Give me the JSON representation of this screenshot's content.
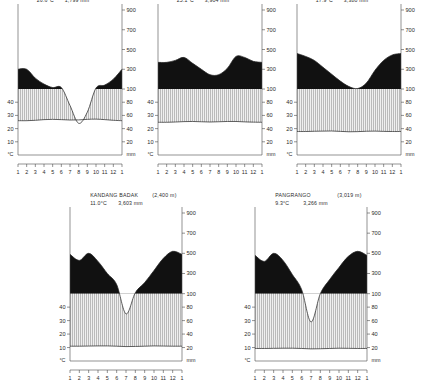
{
  "figure": {
    "caption_present": false,
    "units": {
      "temperature": "°C",
      "precipitation": "mm"
    },
    "month_labels": [
      "1",
      "2",
      "3",
      "4",
      "5",
      "6",
      "7",
      "8",
      "9",
      "10",
      "11",
      "12",
      "1"
    ],
    "temp_ticks_top": [
      "40",
      "30",
      "20",
      "10"
    ],
    "temp_ticks_bottom": [
      "40",
      "30",
      "20",
      "10"
    ],
    "precip_ticks": [
      "900",
      "700",
      "500",
      "300",
      "100",
      "80",
      "60",
      "40",
      "20"
    ],
    "colors": {
      "perhumid_fill": "#111111",
      "humid_fill": "#d8d8d8",
      "axis": "#4a4a4a",
      "curve": "#2a2a2a",
      "background": "#ffffff"
    }
  },
  "chart_data": [
    {
      "type": "area",
      "title": "JAKARTA",
      "altitude": "(8 m)",
      "mean_temp": "26.6°C",
      "annual_precip": "1,799 mm",
      "xlabel": "",
      "ylabel": "°C",
      "y2label": "mm",
      "categories": [
        "1",
        "2",
        "3",
        "4",
        "5",
        "6",
        "7",
        "8",
        "9",
        "10",
        "11",
        "12",
        "1"
      ],
      "series": [
        {
          "name": "precipitation",
          "values": [
            300,
            300,
            210,
            150,
            115,
            115,
            75,
            48,
            65,
            110,
            140,
            200,
            300
          ]
        },
        {
          "name": "temperature",
          "values": [
            26.0,
            26.0,
            26.3,
            26.8,
            27.0,
            26.8,
            26.5,
            26.6,
            27.0,
            27.2,
            26.8,
            26.3,
            26.0
          ]
        }
      ],
      "ylim": [
        0,
        50
      ],
      "y2lim": [
        0,
        900
      ],
      "grid": false
    },
    {
      "type": "area",
      "title": "BOGOR",
      "altitude": "(250 m)",
      "mean_temp": "25.1°C",
      "annual_precip": "3,904 mm",
      "xlabel": "",
      "ylabel": "°C",
      "y2label": "mm",
      "categories": [
        "1",
        "2",
        "3",
        "4",
        "5",
        "6",
        "7",
        "8",
        "9",
        "10",
        "11",
        "12",
        "1"
      ],
      "series": [
        {
          "name": "precipitation",
          "values": [
            370,
            370,
            390,
            420,
            360,
            300,
            245,
            245,
            310,
            430,
            420,
            380,
            370
          ]
        },
        {
          "name": "temperature",
          "values": [
            24.8,
            24.8,
            25.0,
            25.3,
            25.4,
            25.2,
            25.0,
            25.2,
            25.4,
            25.4,
            25.1,
            24.9,
            24.8
          ]
        }
      ],
      "ylim": [
        0,
        50
      ],
      "y2lim": [
        0,
        900
      ],
      "grid": false
    },
    {
      "type": "area",
      "title": "CIBODAS",
      "altitude": "(1,400 m)",
      "mean_temp": "17.9°C",
      "annual_precip": "3,380 mm",
      "xlabel": "",
      "ylabel": "°C",
      "y2label": "mm",
      "categories": [
        "1",
        "2",
        "3",
        "4",
        "5",
        "6",
        "7",
        "8",
        "9",
        "10",
        "11",
        "12",
        "1"
      ],
      "series": [
        {
          "name": "precipitation",
          "values": [
            460,
            430,
            390,
            320,
            250,
            180,
            125,
            105,
            160,
            290,
            390,
            445,
            460
          ]
        },
        {
          "name": "temperature",
          "values": [
            17.8,
            17.8,
            18.0,
            18.1,
            18.2,
            17.9,
            17.6,
            17.7,
            18.0,
            18.1,
            17.9,
            17.8,
            17.8
          ]
        }
      ],
      "ylim": [
        0,
        50
      ],
      "y2lim": [
        0,
        900
      ],
      "grid": false
    },
    {
      "type": "area",
      "title": "KANDANG BADAK",
      "altitude": "(2,400 m)",
      "mean_temp": "11.0°C",
      "annual_precip": "3,603 mm",
      "xlabel": "",
      "ylabel": "°C",
      "y2label": "mm",
      "categories": [
        "1",
        "2",
        "3",
        "4",
        "5",
        "6",
        "7",
        "8",
        "9",
        "10",
        "11",
        "12",
        "1"
      ],
      "series": [
        {
          "name": "precipitation",
          "values": [
            490,
            430,
            500,
            420,
            300,
            190,
            70,
            110,
            210,
            330,
            450,
            520,
            490
          ]
        },
        {
          "name": "temperature",
          "values": [
            11.0,
            11.0,
            11.1,
            11.2,
            11.2,
            11.0,
            10.7,
            10.8,
            11.0,
            11.2,
            11.1,
            11.0,
            11.0
          ]
        }
      ],
      "ylim": [
        0,
        50
      ],
      "y2lim": [
        0,
        900
      ],
      "grid": false
    },
    {
      "type": "area",
      "title": "PANGRANGO",
      "altitude": "(3,019 m)",
      "mean_temp": "9.3°C",
      "annual_precip": "3,266 mm",
      "xlabel": "",
      "ylabel": "°C",
      "y2label": "mm",
      "categories": [
        "1",
        "2",
        "3",
        "4",
        "5",
        "6",
        "7",
        "8",
        "9",
        "10",
        "11",
        "12",
        "1"
      ],
      "series": [
        {
          "name": "precipitation",
          "values": [
            480,
            420,
            500,
            430,
            290,
            140,
            58,
            100,
            240,
            360,
            470,
            520,
            480
          ]
        },
        {
          "name": "temperature",
          "values": [
            9.3,
            9.3,
            9.4,
            9.5,
            9.5,
            9.3,
            9.0,
            9.1,
            9.3,
            9.5,
            9.4,
            9.3,
            9.3
          ]
        }
      ],
      "ylim": [
        0,
        50
      ],
      "y2lim": [
        0,
        900
      ],
      "grid": false
    }
  ]
}
